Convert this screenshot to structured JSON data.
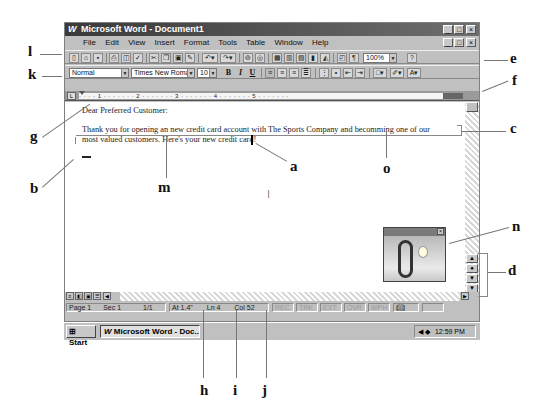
{
  "window": {
    "title": "Microsoft Word - Document1",
    "app_icon": "W",
    "controls": [
      "_",
      "□",
      "×"
    ]
  },
  "menubar": {
    "items": [
      "File",
      "Edit",
      "View",
      "Insert",
      "Format",
      "Tools",
      "Table",
      "Window",
      "Help"
    ],
    "controls": [
      "_",
      "□",
      "×"
    ]
  },
  "standard_toolbar": {
    "icons": [
      "new-icon",
      "open-icon",
      "save-icon",
      "print-icon",
      "print-preview-icon",
      "spelling-icon",
      "cut-icon",
      "copy-icon",
      "paste-icon",
      "format-painter-icon",
      "undo-icon",
      "redo-icon",
      "hyperlink-icon",
      "web-toolbar-icon",
      "tables-borders-icon",
      "insert-table-icon",
      "insert-excel-icon",
      "columns-icon",
      "drawing-icon",
      "document-map-icon",
      "show-hide-icon"
    ],
    "zoom": "100%",
    "help_icon": "?"
  },
  "formatting_toolbar": {
    "style": "Normal",
    "font": "Times New Roman",
    "size": "10",
    "bold": "B",
    "italic": "I",
    "underline": "U"
  },
  "ruler": {
    "marks": "· · · · 1 · · · · · · · 2 · · · · · · · 3 · · · · · · · 4 · · · · · · · 5 · · · · · · ·"
  },
  "document": {
    "line1": "Dear Preferred Customer:",
    "line2": "Thank you for opening an new credit card account with The Sports Company and becomming one of our",
    "line3": "most valued customers. Here's your new credit card!"
  },
  "statusbar": {
    "page": "Page 1",
    "sec": "Sec 1",
    "pages": "1/1",
    "at": "At 1.4\"",
    "ln": "Ln 4",
    "col": "Col 52",
    "rec": "REC",
    "trk": "TRK",
    "ext": "EXT",
    "ovr": "OVR",
    "wph": "WPH"
  },
  "taskbar": {
    "start": "Start",
    "task": "Microsoft Word - Doc...",
    "clock": "12:59 PM"
  },
  "callouts": {
    "a": "a",
    "b": "b",
    "c": "c",
    "d": "d",
    "e": "e",
    "f": "f",
    "g": "g",
    "h": "h",
    "i": "i",
    "j": "j",
    "k": "k",
    "l": "l",
    "m": "m",
    "n": "n",
    "o": "o"
  }
}
